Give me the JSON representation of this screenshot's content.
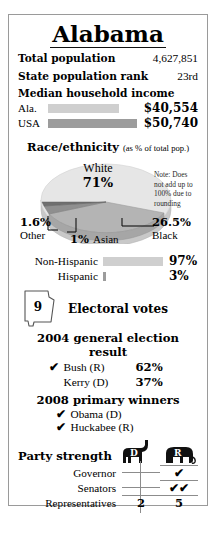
{
  "card": {
    "state_title": "Alabama"
  },
  "stats": [
    {
      "label": "Total population",
      "value": "4,627,851"
    },
    {
      "label": "State population rank",
      "value": "23rd"
    }
  ],
  "income": {
    "heading": "Median household income",
    "rows": [
      {
        "name": "Ala.",
        "amount": "$40,554",
        "bar_pct": 80,
        "color": "#cfcfcf"
      },
      {
        "name": "USA",
        "amount": "$50,740",
        "bar_pct": 100,
        "color": "#9c9c9c"
      }
    ]
  },
  "race": {
    "heading": "Race/ethnicity",
    "subheading": "(as % of total pop.)",
    "note": "Note: Does not add up to 100% due to rounding",
    "slices": [
      {
        "name": "White",
        "pct": "71%",
        "value": 71,
        "color": "#e2e2e2"
      },
      {
        "name": "Black",
        "pct": "26.5%",
        "value": 26.5,
        "color": "#b0b0b0"
      },
      {
        "name": "Asian",
        "pct": "1%",
        "value": 1,
        "color": "#8a8a8a"
      },
      {
        "name": "Other",
        "pct": "1.6%",
        "value": 1.6,
        "color": "#767676"
      }
    ]
  },
  "hispanic": {
    "rows": [
      {
        "name": "Non-Hispanic",
        "pct": "97%",
        "bar_pct": 97,
        "color": "#cfcfcf"
      },
      {
        "name": "Hispanic",
        "pct": "3%",
        "bar_pct": 3,
        "color": "#9c9c9c"
      }
    ]
  },
  "electoral": {
    "votes": "9",
    "label": "Electoral votes"
  },
  "general_election": {
    "heading": "2004 general election result",
    "candidates": [
      {
        "check": "✔",
        "winner": true,
        "name": "Bush (R)",
        "pct": "62%"
      },
      {
        "check": "",
        "winner": false,
        "name": "Kerry (D)",
        "pct": "37%"
      }
    ]
  },
  "primary": {
    "heading": "2008 primary winners",
    "winners": [
      {
        "check": "✔",
        "name": "Obama (D)"
      },
      {
        "check": "✔",
        "name": "Huckabee (R)"
      }
    ]
  },
  "party_strength": {
    "title": "Party strength",
    "columns": [
      "D",
      "R"
    ],
    "rows": [
      {
        "label": "Governor",
        "d": "",
        "r": "✔"
      },
      {
        "label": "Senators",
        "d": "",
        "r": "✔✔"
      },
      {
        "label": "Representatives",
        "d": "2",
        "r": "5"
      }
    ]
  }
}
